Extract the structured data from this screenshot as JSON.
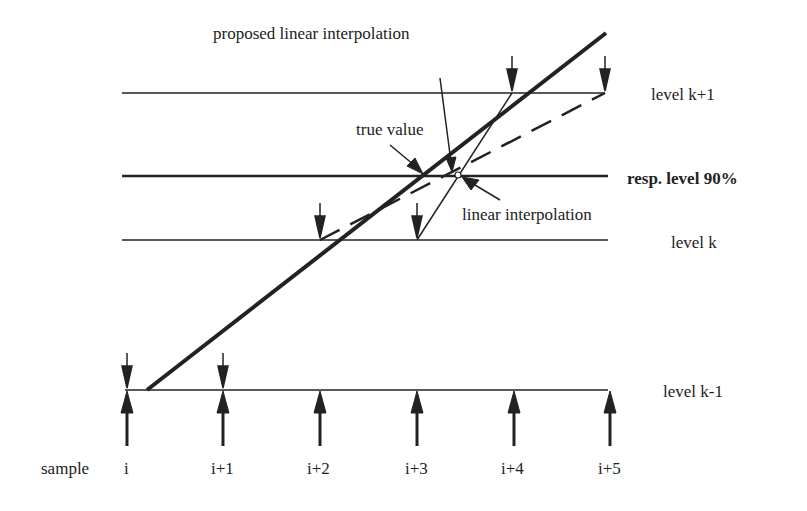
{
  "labels": {
    "proposed": "proposed linear interpolation",
    "true_value": "true value",
    "linear": "linear interpolation",
    "level_k1": "level k+1",
    "resp_level": "resp. level 90%",
    "level_k": "level k",
    "level_km1": "level k-1",
    "sample": "sample"
  },
  "samples": [
    "i",
    "i+1",
    "i+2",
    "i+3",
    "i+4",
    "i+5"
  ],
  "colors": {
    "ink": "#222222",
    "background": "#ffffff"
  }
}
